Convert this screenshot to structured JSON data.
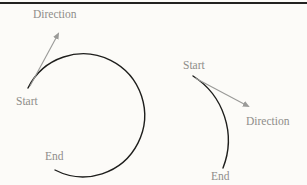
{
  "figure": {
    "type": "arc-direction-diagram",
    "colors": {
      "background": "#fcfbf8",
      "top_rule": "#222220",
      "arc_stroke": "#1e1e1c",
      "arrow_stroke": "#9a9a98",
      "label_text": "#8f8d8a"
    },
    "left_diagram": {
      "shape": "large circular arc (~260 degrees, clockwise)",
      "start_label": "Start",
      "end_label": "End",
      "direction_label": "Direction"
    },
    "right_diagram": {
      "shape": "short circular arc (~80 degrees, clockwise)",
      "start_label": "Start",
      "end_label": "End",
      "direction_label": "Direction"
    }
  }
}
